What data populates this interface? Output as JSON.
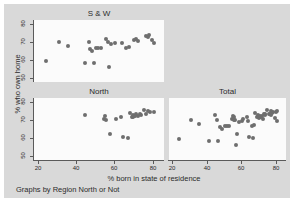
{
  "figure": {
    "note": "Graphs by Region North or Not",
    "y_axis_title": "% who own home",
    "x_axis_title": "% born in state of residence",
    "background_color": "#d9d9d9",
    "panel_color": "#fbfbfb",
    "marker_color": "#6e6e6e",
    "axis_color": "#5a5a5a"
  },
  "chart_data": {
    "type": "scatter",
    "title": "",
    "xlabel": "% born in state of residence",
    "ylabel": "% who own home",
    "xlim": [
      18,
      86
    ],
    "ylim": [
      48,
      82
    ],
    "xticks": [
      20,
      40,
      60,
      80
    ],
    "yticks": [
      50,
      60,
      70,
      80
    ],
    "grid": false,
    "legend": "none",
    "layout": "2x2 small multiples, bottom-right of first row empty",
    "panels": [
      {
        "name": "S & W",
        "position": "top-left",
        "n": 27,
        "points": [
          [
            24.0,
            59.8
          ],
          [
            31.0,
            69.8
          ],
          [
            35.5,
            68.0
          ],
          [
            44.5,
            58.6
          ],
          [
            46.5,
            70.2
          ],
          [
            47.5,
            66.0
          ],
          [
            48.5,
            65.3
          ],
          [
            49.5,
            58.7
          ],
          [
            50.5,
            66.8
          ],
          [
            51.5,
            66.6
          ],
          [
            53.0,
            66.5
          ],
          [
            55.5,
            71.5
          ],
          [
            56.5,
            70.2
          ],
          [
            57.0,
            56.4
          ],
          [
            58.5,
            68.8
          ],
          [
            60.5,
            69.3
          ],
          [
            64.0,
            69.5
          ],
          [
            66.0,
            66.9
          ],
          [
            67.5,
            67.3
          ],
          [
            70.5,
            71.2
          ],
          [
            71.5,
            71.5
          ],
          [
            72.5,
            70.6
          ],
          [
            76.5,
            73.3
          ],
          [
            77.5,
            72.8
          ],
          [
            78.0,
            74.0
          ],
          [
            79.5,
            71.2
          ],
          [
            81.0,
            69.4
          ]
        ]
      },
      {
        "name": "North",
        "position": "bottom-left",
        "n": 24,
        "points": [
          [
            44.5,
            72.8
          ],
          [
            54.5,
            70.6
          ],
          [
            55.0,
            72.4
          ],
          [
            55.5,
            69.7
          ],
          [
            57.5,
            62.4
          ],
          [
            61.0,
            70.6
          ],
          [
            63.5,
            71.7
          ],
          [
            64.5,
            60.9
          ],
          [
            67.0,
            59.9
          ],
          [
            68.0,
            73.9
          ],
          [
            69.0,
            71.7
          ],
          [
            69.5,
            72.6
          ],
          [
            70.0,
            71.4
          ],
          [
            70.5,
            72.2
          ],
          [
            71.0,
            71.9
          ],
          [
            71.5,
            73.0
          ],
          [
            72.5,
            72.1
          ],
          [
            73.5,
            73.4
          ],
          [
            74.0,
            72.6
          ],
          [
            75.5,
            75.5
          ],
          [
            76.5,
            73.5
          ],
          [
            77.5,
            75.0
          ],
          [
            78.5,
            74.3
          ],
          [
            80.5,
            74.4
          ]
        ]
      },
      {
        "name": "Total",
        "position": "bottom-right",
        "n": 51,
        "points": [
          [
            24.0,
            59.8
          ],
          [
            31.0,
            69.8
          ],
          [
            35.5,
            68.0
          ],
          [
            41.5,
            58.6
          ],
          [
            44.5,
            72.8
          ],
          [
            46.0,
            70.2
          ],
          [
            46.5,
            58.7
          ],
          [
            47.5,
            66.0
          ],
          [
            48.5,
            65.3
          ],
          [
            50.5,
            66.8
          ],
          [
            51.5,
            66.6
          ],
          [
            53.0,
            66.5
          ],
          [
            54.5,
            70.6
          ],
          [
            55.0,
            72.4
          ],
          [
            55.5,
            69.7
          ],
          [
            56.0,
            71.5
          ],
          [
            56.5,
            70.2
          ],
          [
            57.0,
            56.4
          ],
          [
            57.5,
            62.4
          ],
          [
            58.5,
            68.8
          ],
          [
            60.5,
            69.3
          ],
          [
            61.0,
            70.6
          ],
          [
            63.5,
            71.7
          ],
          [
            64.0,
            69.5
          ],
          [
            64.5,
            60.9
          ],
          [
            66.0,
            66.9
          ],
          [
            67.0,
            59.9
          ],
          [
            67.5,
            67.3
          ],
          [
            68.0,
            73.9
          ],
          [
            69.0,
            71.7
          ],
          [
            69.5,
            72.6
          ],
          [
            70.0,
            71.4
          ],
          [
            70.5,
            71.2
          ],
          [
            71.0,
            71.9
          ],
          [
            71.5,
            71.5
          ],
          [
            72.0,
            72.2
          ],
          [
            72.5,
            70.6
          ],
          [
            73.0,
            73.0
          ],
          [
            73.5,
            73.4
          ],
          [
            74.0,
            72.6
          ],
          [
            75.0,
            75.5
          ],
          [
            76.0,
            73.5
          ],
          [
            76.5,
            73.3
          ],
          [
            77.0,
            75.0
          ],
          [
            77.5,
            72.8
          ],
          [
            78.0,
            74.0
          ],
          [
            78.5,
            74.3
          ],
          [
            79.5,
            71.2
          ],
          [
            80.0,
            74.4
          ],
          [
            80.5,
            74.8
          ],
          [
            81.0,
            69.4
          ]
        ]
      }
    ]
  }
}
